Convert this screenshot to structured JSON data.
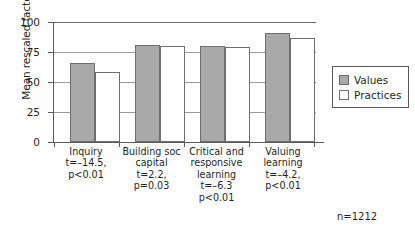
{
  "chart_data": {
    "type": "bar",
    "title": "",
    "xlabel": "",
    "ylabel": "Mean rescaled factor score",
    "ylim": [
      0,
      100
    ],
    "yticks": [
      0,
      25,
      50,
      75,
      100
    ],
    "grid": true,
    "legend_position": "right",
    "categories": [
      "Inquiry",
      "Building soc capital",
      "Critical and responsive learning",
      "Valuing learning"
    ],
    "series": [
      {
        "name": "Values",
        "values": [
          66,
          81,
          80,
          91
        ],
        "color": "#a9a9a9"
      },
      {
        "name": "Practices",
        "values": [
          58,
          80,
          79,
          87
        ],
        "color": "#ffffff"
      }
    ],
    "annotations": {
      "n": "n=1212",
      "stats": [
        {
          "t": "t=–14.5,",
          "p": "p<0.01"
        },
        {
          "t": "t=2.2,",
          "p": "p=0.03"
        },
        {
          "t": "t=–6.3",
          "p": "p<0.01"
        },
        {
          "t": "t=–4.2,",
          "p": "p<0.01"
        }
      ]
    }
  },
  "axis": {
    "y_title": "Mean rescaled factor score",
    "y_tick_labels": [
      "100",
      "75",
      "50",
      "25",
      "0"
    ]
  },
  "categories": [
    {
      "line1": "Inquiry",
      "line2": "",
      "t": "t=–14.5,",
      "p": "p<0.01"
    },
    {
      "line1": "Building soc",
      "line2": "capital",
      "t": "t=2.2,",
      "p": "p=0.03"
    },
    {
      "line1": "Critical and",
      "line2": "responsive",
      "line3": "learning",
      "t": "t=–6.3",
      "p": "p<0.01"
    },
    {
      "line1": "Valuing",
      "line2": "learning",
      "t": "t=–4.2,",
      "p": "p<0.01"
    }
  ],
  "legend": {
    "items": [
      {
        "label": "Values"
      },
      {
        "label": "Practices"
      }
    ]
  },
  "note": {
    "n": "n=1212"
  }
}
